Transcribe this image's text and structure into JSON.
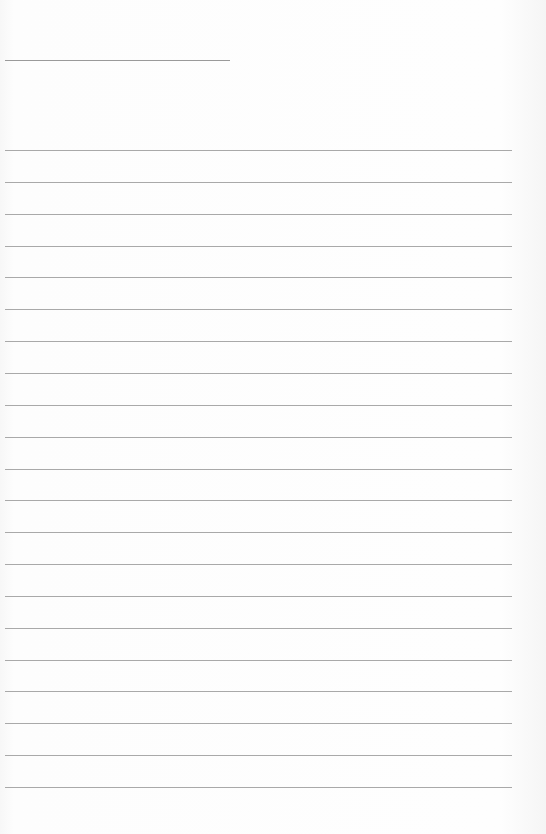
{
  "document": {
    "type": "lined-paper",
    "title_line": {
      "top": 60,
      "left": 5,
      "width": 225
    },
    "rules": {
      "count": 21,
      "first_top": 150,
      "spacing": 31.85,
      "left": 5,
      "width": 507
    },
    "colors": {
      "paper": "#fdfdfd",
      "rule": "#a9a9a9",
      "title_line": "#9a9a9a"
    }
  }
}
